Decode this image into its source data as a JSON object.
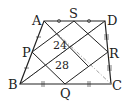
{
  "diagram": {
    "type": "geometry-trapezoid",
    "points": {
      "A": {
        "label": "A",
        "x": 44,
        "y": 21
      },
      "D": {
        "label": "D",
        "x": 105,
        "y": 21
      },
      "B": {
        "label": "B",
        "x": 20,
        "y": 84
      },
      "C": {
        "label": "C",
        "x": 111,
        "y": 84
      },
      "S": {
        "label": "S",
        "x": 74,
        "y": 21
      },
      "P": {
        "label": "P",
        "x": 32,
        "y": 52
      },
      "Q": {
        "label": "Q",
        "x": 65,
        "y": 84
      },
      "R": {
        "label": "R",
        "x": 108,
        "y": 52
      }
    },
    "areas": [
      {
        "value": "24"
      },
      {
        "value": "28"
      }
    ],
    "tick_marks": {
      "AS_SD": "circle",
      "DR_RC": "triple",
      "BQ_QC": "double",
      "AP_PB": "single"
    },
    "colors": {
      "line": "#222222",
      "dash": "#888888",
      "background": "#ffffff"
    }
  }
}
